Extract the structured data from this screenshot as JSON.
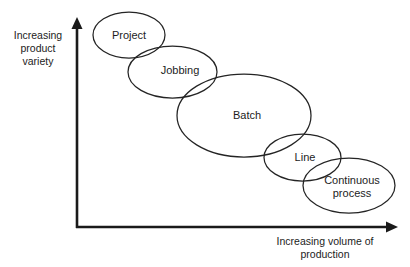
{
  "figure": {
    "background_color": "#ffffff",
    "stroke_color": "#242424",
    "axis_color": "#1a1a1a",
    "text_color": "#1c1c1c"
  },
  "axes": {
    "y_axis": {
      "icon": "up-arrow-icon",
      "label": "Increasing\nproduct\nvariety",
      "label_x": 38,
      "label_y": 48,
      "x": 77,
      "y_top": 18,
      "y_bottom": 228
    },
    "x_axis": {
      "icon": "right-arrow-icon",
      "label": "Increasing volume of\nproduction",
      "label_x": 325,
      "label_y": 248,
      "y": 227,
      "x_left": 76,
      "x_right": 398
    }
  },
  "nodes": [
    {
      "id": "project",
      "label": "Project",
      "cx": 129,
      "cy": 35,
      "rx": 36,
      "ry": 23,
      "label_x": 129,
      "label_y": 35
    },
    {
      "id": "jobbing",
      "label": "Jobbing",
      "cx": 172.5,
      "cy": 72,
      "rx": 44.5,
      "ry": 26,
      "label_x": 180,
      "label_y": 70
    },
    {
      "id": "batch",
      "label": "Batch",
      "cx": 244,
      "cy": 115.5,
      "rx": 67,
      "ry": 41.5,
      "label_x": 247,
      "label_y": 115
    },
    {
      "id": "line",
      "label": "Line",
      "cx": 302.5,
      "cy": 157.5,
      "rx": 38.5,
      "ry": 23.5,
      "label_x": 305,
      "label_y": 157
    },
    {
      "id": "continuous-process",
      "label": "Continuous\nprocess",
      "cx": 349,
      "cy": 185.5,
      "rx": 46,
      "ry": 27.5,
      "label_x": 352,
      "label_y": 186
    }
  ]
}
